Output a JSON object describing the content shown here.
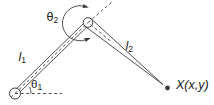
{
  "figure": {
    "background_color": "#ffffff",
    "ink_color": "#3d3d3d",
    "text_color": "#222222"
  },
  "labels": {
    "link1": {
      "base": "l",
      "sub": "1"
    },
    "link2": {
      "base": "l",
      "sub": "2"
    },
    "theta1": {
      "base": "θ",
      "sub": "1"
    },
    "theta2": {
      "base": "θ",
      "sub": "2"
    },
    "endpoint": {
      "text": "X(x,y)"
    }
  }
}
